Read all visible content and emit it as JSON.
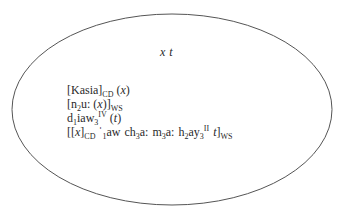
{
  "diagram": {
    "type": "ellipse-box",
    "ellipse": {
      "cx": 172,
      "cy": 109.5,
      "rx": 160,
      "ry": 95.5,
      "stroke": "#555555",
      "fill": "#ffffff"
    },
    "header": {
      "variables": [
        "x",
        "t"
      ],
      "text": "x t"
    },
    "lines": [
      {
        "parts": {
          "open": "[Kasia]",
          "sub": "CD",
          "arg": " (",
          "var": "x",
          "close": ")"
        },
        "plain": "[Kasia]CD (x)"
      },
      {
        "parts": {
          "a": "[n",
          "sub1": "2",
          "b": "u: (",
          "var": "x",
          "c": ")]",
          "sub2": "WS"
        },
        "plain": "[n2u: (x)]WS"
      },
      {
        "parts": {
          "a": "d",
          "sub1": "1",
          "b": "iaw",
          "sub2": "3",
          "sup": "IV",
          "c": " (",
          "var": "t",
          "d": ")"
        },
        "plain": "d1iaw3IV (t)"
      },
      {
        "parts": {
          "a": "[[",
          "var1": "x",
          "b": "]",
          "sub_cd": "CD",
          "stress": " ˈ",
          "sub1": "1",
          "c": "aw",
          "d": "ch",
          "sub3a": "3",
          "e": "a:",
          "f": "m",
          "sub3b": "3",
          "g": "a:",
          "h": "h",
          "sub2": "2",
          "i": "ay",
          "sub3c": "3",
          "sup": "II",
          "var2": "t",
          "j": "]",
          "sub_ws": "WS"
        },
        "plain": "[[x]CD ˈ1aw ch3a: m3a: h2ay3II t]WS"
      }
    ]
  }
}
